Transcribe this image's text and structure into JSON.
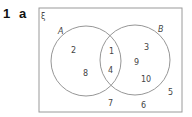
{
  "question": {
    "number": "1",
    "part": "a"
  },
  "venn": {
    "universal_symbol": "ξ",
    "sets": [
      {
        "name": "A",
        "label": "A"
      },
      {
        "name": "B",
        "label": "B"
      }
    ],
    "regions": {
      "A_only": [
        "2",
        "8"
      ],
      "A_and_B": [
        "1",
        "4"
      ],
      "B_only": [
        "3",
        "9",
        "10"
      ],
      "outside": [
        "7",
        "6",
        "5"
      ]
    },
    "labels": {
      "a_only_1": "2",
      "a_only_2": "8",
      "both_1": "1",
      "both_2": "4",
      "b_only_1": "3",
      "b_only_2": "9",
      "b_only_3": "10",
      "outside_1": "7",
      "outside_2": "6",
      "outside_3": "5"
    },
    "colors": {
      "stroke": "#8a8a8a",
      "text": "#444444"
    }
  }
}
